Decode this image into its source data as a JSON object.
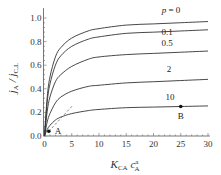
{
  "chart_data": {
    "type": "line",
    "title": "",
    "xlabel": "K_CA c_A^a",
    "ylabel": "j_A / j_C,L",
    "xlim": [
      0,
      30
    ],
    "ylim": [
      0,
      1.05
    ],
    "grid": false,
    "x_ticks": [
      0,
      5,
      10,
      15,
      20,
      25,
      30
    ],
    "y_ticks": [
      0.0,
      0.2,
      0.4,
      0.6,
      0.8,
      1.0
    ],
    "x_tick_labels": [
      "0",
      "5",
      "10",
      "15",
      "20",
      "25",
      "30"
    ],
    "y_tick_labels": [
      "0.0",
      "0.2",
      "0.4",
      "0.6",
      "0.8",
      "1.0"
    ],
    "x": [
      0,
      0.5,
      1,
      2,
      3,
      5,
      8,
      10,
      15,
      20,
      25,
      30
    ],
    "series": [
      {
        "name": "p = 0",
        "label": "p = 0",
        "values": [
          0,
          0.33,
          0.5,
          0.67,
          0.75,
          0.83,
          0.89,
          0.91,
          0.94,
          0.95,
          0.96,
          0.97
        ]
      },
      {
        "name": "0.1",
        "label": "0.1",
        "values": [
          0,
          0.29,
          0.44,
          0.6,
          0.68,
          0.76,
          0.82,
          0.84,
          0.87,
          0.88,
          0.89,
          0.9
        ]
      },
      {
        "name": "0.5",
        "label": "0.5",
        "values": [
          0,
          0.21,
          0.33,
          0.46,
          0.52,
          0.59,
          0.65,
          0.67,
          0.69,
          0.7,
          0.71,
          0.72
        ]
      },
      {
        "name": "2",
        "label": "2",
        "values": [
          0,
          0.12,
          0.19,
          0.28,
          0.33,
          0.38,
          0.42,
          0.43,
          0.45,
          0.46,
          0.47,
          0.48
        ]
      },
      {
        "name": "10",
        "label": "10",
        "values": [
          0,
          0.055,
          0.09,
          0.135,
          0.16,
          0.19,
          0.215,
          0.225,
          0.24,
          0.245,
          0.25,
          0.255
        ]
      }
    ],
    "tangent_line": {
      "style": "dashed",
      "x": [
        0.8,
        5.2
      ],
      "y": [
        0.04,
        0.26
      ]
    },
    "points": [
      {
        "name": "A",
        "x": 0.8,
        "y": 0.04
      },
      {
        "name": "B",
        "x": 25,
        "y": 0.25
      }
    ]
  }
}
